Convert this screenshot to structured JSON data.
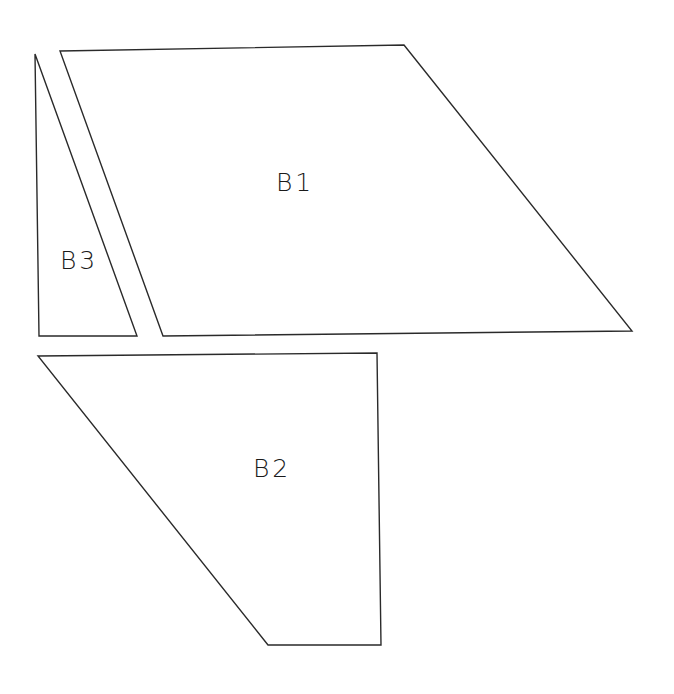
{
  "diagram": {
    "background": "#ffffff",
    "stroke_color": "#2a2a2a",
    "shapes": [
      {
        "id": "B1",
        "label": "B1",
        "type": "quadrilateral",
        "points": "60,51 404,45 632,331 163,336",
        "label_pos": {
          "x": 276,
          "y": 170
        }
      },
      {
        "id": "B2",
        "label": "B2",
        "type": "quadrilateral",
        "points": "38,356 377,353 381,645 268,645",
        "label_pos": {
          "x": 253,
          "y": 456
        }
      },
      {
        "id": "B3",
        "label": "B3",
        "type": "triangle",
        "points": "35,54 137,336 39,336",
        "label_pos": {
          "x": 60,
          "y": 248
        }
      }
    ]
  }
}
